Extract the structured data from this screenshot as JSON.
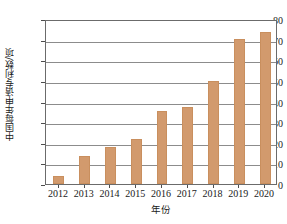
{
  "chart_data": {
    "type": "bar",
    "title": "",
    "categories": [
      "2012",
      "2013",
      "2014",
      "2015",
      "2016",
      "2017",
      "2018",
      "2019",
      "2020"
    ],
    "values": [
      4,
      13.5,
      18,
      22,
      35.5,
      37.5,
      50,
      70.5,
      73.5
    ],
    "xlabel": "年份",
    "ylabel": "中国每年申请专利数/项",
    "ylim": [
      0,
      80
    ],
    "ytick_labels": [
      "0",
      "10",
      "20",
      "30",
      "40",
      "50",
      "60",
      "70",
      "80"
    ],
    "ytick_values": [
      0,
      10,
      20,
      30,
      40,
      50,
      60,
      70,
      80
    ],
    "grid": "horizontal",
    "legend": "none",
    "bar_color": "#d29a6d",
    "axis_color": "#6b6b6b",
    "gridline_color": "#8c8c8c",
    "text_color": "#1a1a1a"
  }
}
